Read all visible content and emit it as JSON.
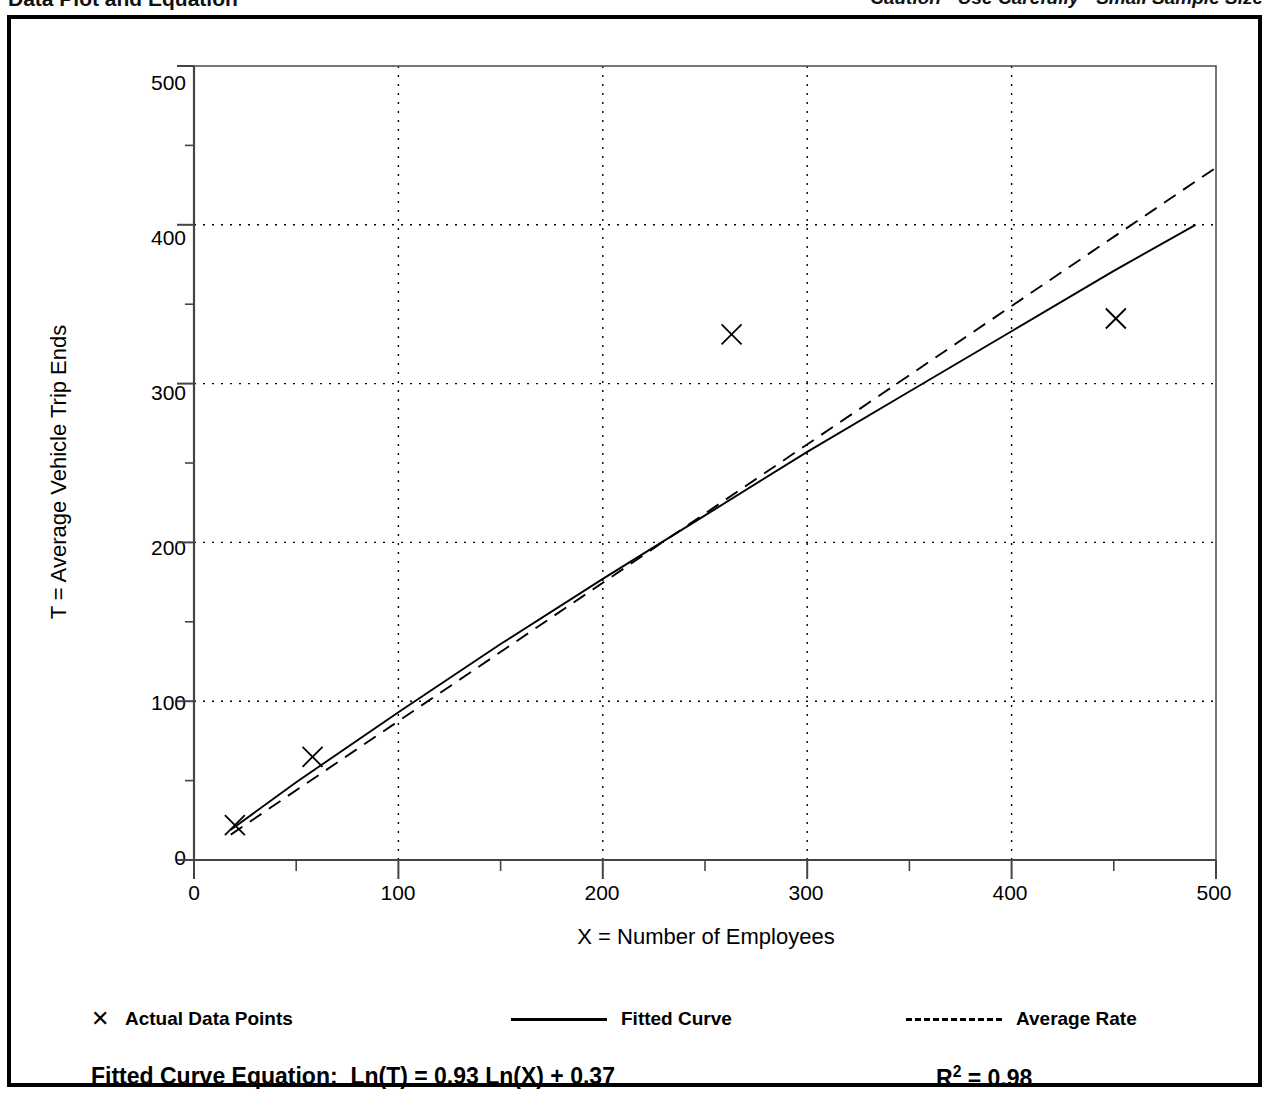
{
  "header": {
    "title": "Data Plot and Equation",
    "note": "Caution - Use Carefully - Small Sample Size"
  },
  "legend": {
    "points_label": "Actual Data Points",
    "points_marker": "x-mark-icon",
    "fitted_label": "Fitted Curve",
    "fitted_marker": "solid-line-icon",
    "average_label": "Average Rate",
    "average_marker": "dashed-line-icon"
  },
  "equation": {
    "label": "Fitted Curve Equation:  Ln(T) = 0.93 Ln(X) + 0.37",
    "r2_prefix": "R",
    "r2_exponent": "2",
    "r2_suffix": " = 0.98"
  },
  "chart_data": {
    "type": "scatter",
    "title": "Data Plot and Equation",
    "xlabel": "X = Number of Employees",
    "ylabel": "T = Average Vehicle Trip Ends",
    "xlim": [
      0,
      500
    ],
    "ylim": [
      0,
      500
    ],
    "xticks": [
      0,
      100,
      200,
      300,
      400,
      500
    ],
    "yticks": [
      0,
      100,
      200,
      300,
      400,
      500
    ],
    "x_minor_tick_interval": 50,
    "y_minor_tick_interval": 50,
    "grid": true,
    "grid_style": "dotted",
    "legend_position": "below-axis",
    "series": [
      {
        "name": "Actual Data Points",
        "type": "scatter",
        "marker": "x",
        "points": [
          {
            "x": 20,
            "y": 22
          },
          {
            "x": 58,
            "y": 65
          },
          {
            "x": 263,
            "y": 331
          },
          {
            "x": 451,
            "y": 341
          }
        ]
      },
      {
        "name": "Fitted Curve",
        "type": "line",
        "style": "solid",
        "equation": "Ln(T) = 0.93 Ln(X) + 0.37",
        "r_squared": 0.98,
        "points": [
          {
            "x": 18,
            "y": 19
          },
          {
            "x": 50,
            "y": 49
          },
          {
            "x": 100,
            "y": 93
          },
          {
            "x": 150,
            "y": 136
          },
          {
            "x": 200,
            "y": 177
          },
          {
            "x": 250,
            "y": 217
          },
          {
            "x": 300,
            "y": 257
          },
          {
            "x": 350,
            "y": 295
          },
          {
            "x": 400,
            "y": 333
          },
          {
            "x": 450,
            "y": 371
          },
          {
            "x": 490,
            "y": 400
          }
        ]
      },
      {
        "name": "Average Rate",
        "type": "line",
        "style": "dashed",
        "points": [
          {
            "x": 18,
            "y": 16
          },
          {
            "x": 500,
            "y": 436
          }
        ]
      }
    ]
  }
}
